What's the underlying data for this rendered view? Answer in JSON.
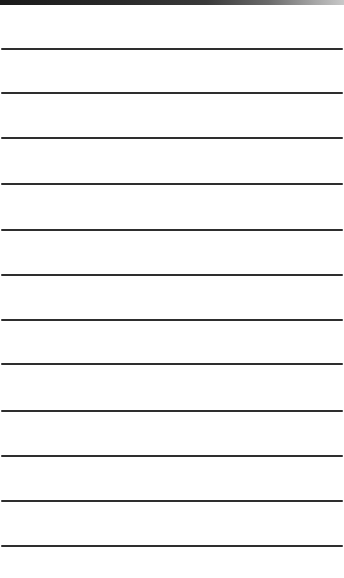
{
  "page": {
    "type": "ruled-notepad",
    "background_color": "#ffffff",
    "top_band_color": "#1a1a1a",
    "rule_color": "#2e2e2e",
    "rule_count": 12,
    "rules_y": [
      48,
      92,
      137,
      183,
      229,
      274,
      319,
      363,
      410,
      455,
      500,
      545
    ]
  }
}
